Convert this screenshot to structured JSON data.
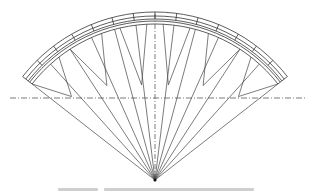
{
  "figure": {
    "type": "fan-shaped structural line drawing",
    "apex": {
      "x": 155,
      "y": 180
    },
    "arc": {
      "radius": 168,
      "start_deg": -52,
      "end_deg": 52,
      "band_offsets": [
        0,
        4,
        7,
        9,
        12
      ]
    },
    "segment_count": 14,
    "centerline_horizontal": {
      "y": 98,
      "x1": 10,
      "x2": 305
    },
    "centerline_vertical": {
      "x": 155,
      "y1": 14,
      "y2": 180
    },
    "stroke_color": "#333333",
    "centerline_color": "#444444"
  },
  "caption": {
    "legible": false,
    "note": "caption text present below figure but illegible at this resolution"
  }
}
